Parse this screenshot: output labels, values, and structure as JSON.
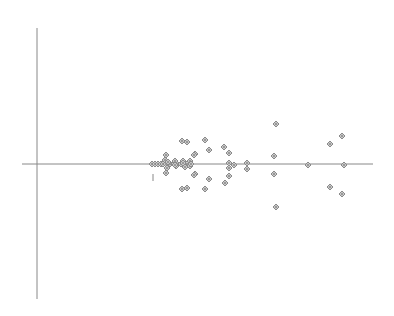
{
  "chart_data": {
    "type": "scatter",
    "title": "",
    "xlabel": "",
    "ylabel": "",
    "grid": false,
    "legend": null,
    "axes": {
      "y_axis": {
        "x": 37,
        "y1": 28,
        "y2": 299
      },
      "x_axis": {
        "y": 164,
        "x1": 22,
        "x2": 373
      },
      "color": "#888888"
    },
    "marker": {
      "shape": "diamond",
      "size": 6,
      "stroke": "#8a8a8a",
      "fill": "#c8c8c8"
    },
    "annotation": {
      "type": "tick-mark",
      "x": 153,
      "y1": 174,
      "y2": 181
    },
    "points_px": [
      [
        152,
        164
      ],
      [
        155,
        164
      ],
      [
        158,
        164
      ],
      [
        161,
        164
      ],
      [
        163,
        164
      ],
      [
        166,
        164
      ],
      [
        170,
        164
      ],
      [
        174,
        164
      ],
      [
        177,
        164
      ],
      [
        181,
        164
      ],
      [
        184,
        164
      ],
      [
        187,
        164
      ],
      [
        191,
        164
      ],
      [
        166,
        155
      ],
      [
        165,
        160
      ],
      [
        168,
        162
      ],
      [
        167,
        168
      ],
      [
        166,
        173
      ],
      [
        175,
        161
      ],
      [
        176,
        166
      ],
      [
        183,
        161
      ],
      [
        185,
        166
      ],
      [
        190,
        161
      ],
      [
        190,
        166
      ],
      [
        195,
        154
      ],
      [
        195,
        174
      ],
      [
        182,
        141
      ],
      [
        187,
        142
      ],
      [
        205,
        140
      ],
      [
        209,
        150
      ],
      [
        224,
        147
      ],
      [
        229,
        153
      ],
      [
        194,
        155
      ],
      [
        175,
        165
      ],
      [
        183,
        163
      ],
      [
        185,
        167
      ],
      [
        191,
        164
      ],
      [
        229,
        163
      ],
      [
        234,
        165
      ],
      [
        247,
        163
      ],
      [
        247,
        169
      ],
      [
        229,
        168
      ],
      [
        194,
        175
      ],
      [
        209,
        179
      ],
      [
        225,
        183
      ],
      [
        229,
        176
      ],
      [
        182,
        189
      ],
      [
        187,
        188
      ],
      [
        205,
        189
      ],
      [
        276,
        124
      ],
      [
        274,
        156
      ],
      [
        274,
        174
      ],
      [
        276,
        207
      ],
      [
        308,
        165
      ],
      [
        330,
        144
      ],
      [
        342,
        136
      ],
      [
        344,
        165
      ],
      [
        330,
        187
      ],
      [
        342,
        194
      ]
    ]
  }
}
